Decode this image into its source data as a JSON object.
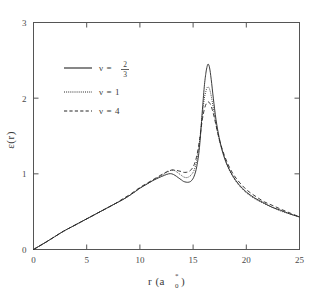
{
  "chart_data": {
    "type": "line",
    "title": "",
    "xlabel": "r (a0*)",
    "xlabel_main": "r (a",
    "xlabel_sub": "0",
    "xlabel_sup": "*",
    "xlabel_close": ")",
    "ylabel": "ε(r)",
    "xlim": [
      0,
      25
    ],
    "ylim": [
      0,
      3
    ],
    "xticks": [
      "0",
      "5",
      "10",
      "15",
      "20",
      "25"
    ],
    "xtick_values": [
      0,
      5,
      10,
      15,
      20,
      25
    ],
    "yticks": [
      "0",
      "1",
      "2",
      "3"
    ],
    "ytick_values": [
      0,
      1,
      2,
      3
    ],
    "grid": false,
    "legend_position": "upper-left-inside",
    "series": [
      {
        "name": "nu = 2/3",
        "label_prefix": "ν  =",
        "numerator": "2",
        "denominator": "3",
        "style": "solid",
        "peak_x": 16.4,
        "peak_y": 2.45,
        "x": [
          0,
          0.6,
          1.2,
          2,
          2.8,
          3.6,
          4.4,
          5.2,
          6,
          6.8,
          7.6,
          8.4,
          9.2,
          10,
          10.6,
          11.2,
          11.8,
          12.3,
          12.7,
          13.0,
          13.3,
          13.6,
          13.9,
          14.1,
          14.35,
          14.6,
          14.85,
          15.1,
          15.35,
          15.6,
          15.85,
          16.05,
          16.2,
          16.32,
          16.42,
          16.55,
          16.7,
          16.9,
          17.15,
          17.45,
          17.8,
          18.2,
          18.7,
          19.3,
          20,
          20.8,
          21.6,
          22.4,
          23.2,
          24.1,
          25
        ],
        "y": [
          0,
          0.05,
          0.1,
          0.17,
          0.24,
          0.3,
          0.36,
          0.42,
          0.48,
          0.54,
          0.6,
          0.66,
          0.73,
          0.81,
          0.86,
          0.91,
          0.95,
          0.98,
          1.0,
          1.0,
          0.98,
          0.95,
          0.92,
          0.9,
          0.89,
          0.89,
          0.91,
          0.97,
          1.1,
          1.35,
          1.8,
          2.15,
          2.33,
          2.42,
          2.45,
          2.4,
          2.25,
          2.0,
          1.72,
          1.48,
          1.28,
          1.12,
          0.98,
          0.86,
          0.76,
          0.68,
          0.62,
          0.56,
          0.52,
          0.47,
          0.43
        ]
      },
      {
        "name": "nu = 1",
        "label": "ν  =  1",
        "style": "dotted",
        "peak_x": 16.4,
        "peak_y": 2.15,
        "x": [
          0,
          0.6,
          1.2,
          2,
          2.8,
          3.6,
          4.4,
          5.2,
          6,
          6.8,
          7.6,
          8.4,
          9.2,
          10,
          10.6,
          11.2,
          11.8,
          12.3,
          12.7,
          13.0,
          13.3,
          13.6,
          13.9,
          14.1,
          14.35,
          14.6,
          14.85,
          15.1,
          15.35,
          15.6,
          15.85,
          16.05,
          16.2,
          16.32,
          16.42,
          16.55,
          16.7,
          16.9,
          17.15,
          17.45,
          17.8,
          18.2,
          18.7,
          19.3,
          20,
          20.8,
          21.6,
          22.4,
          23.2,
          24.1,
          25
        ],
        "y": [
          0,
          0.05,
          0.1,
          0.17,
          0.24,
          0.3,
          0.36,
          0.42,
          0.48,
          0.54,
          0.6,
          0.66,
          0.73,
          0.81,
          0.86,
          0.91,
          0.96,
          1.0,
          1.03,
          1.05,
          1.04,
          1.01,
          0.98,
          0.96,
          0.95,
          0.96,
          0.99,
          1.05,
          1.18,
          1.42,
          1.76,
          1.99,
          2.09,
          2.14,
          2.15,
          2.12,
          2.03,
          1.87,
          1.66,
          1.45,
          1.27,
          1.11,
          0.97,
          0.85,
          0.75,
          0.67,
          0.61,
          0.56,
          0.51,
          0.47,
          0.43
        ]
      },
      {
        "name": "nu = 4",
        "label": "ν  =  4",
        "style": "dashed",
        "peak_x": 16.45,
        "peak_y": 1.95,
        "x": [
          0,
          0.6,
          1.2,
          2,
          2.8,
          3.6,
          4.4,
          5.2,
          6,
          6.8,
          7.6,
          8.4,
          9.2,
          10,
          10.6,
          11.2,
          11.8,
          12.3,
          12.7,
          13.0,
          13.3,
          13.6,
          13.9,
          14.1,
          14.35,
          14.6,
          14.85,
          15.1,
          15.35,
          15.6,
          15.85,
          16.05,
          16.25,
          16.45,
          16.62,
          16.8,
          17.0,
          17.25,
          17.55,
          17.9,
          18.3,
          18.8,
          19.4,
          20.1,
          20.9,
          21.7,
          22.5,
          23.3,
          24.15,
          25
        ],
        "y": [
          0,
          0.05,
          0.1,
          0.17,
          0.24,
          0.3,
          0.36,
          0.42,
          0.48,
          0.54,
          0.6,
          0.67,
          0.74,
          0.82,
          0.87,
          0.92,
          0.97,
          1.01,
          1.04,
          1.05,
          1.05,
          1.04,
          1.03,
          1.02,
          1.02,
          1.03,
          1.06,
          1.12,
          1.24,
          1.44,
          1.7,
          1.85,
          1.93,
          1.95,
          1.92,
          1.85,
          1.74,
          1.58,
          1.41,
          1.26,
          1.12,
          0.99,
          0.88,
          0.78,
          0.7,
          0.63,
          0.58,
          0.53,
          0.48,
          0.43
        ]
      }
    ]
  }
}
